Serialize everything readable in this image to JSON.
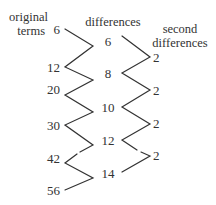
{
  "headers": {
    "original_line1": "original",
    "original_line2": "terms",
    "differences": "differences",
    "second_line1": "second",
    "second_line2": "differences"
  },
  "original_terms": [
    "6",
    "12",
    "20",
    "30",
    "42",
    "56"
  ],
  "differences": [
    "6",
    "8",
    "10",
    "12",
    "14"
  ],
  "second_differences": [
    "2",
    "2",
    "2",
    "2"
  ],
  "colors": {
    "line": "#333333",
    "text": "#333333"
  }
}
